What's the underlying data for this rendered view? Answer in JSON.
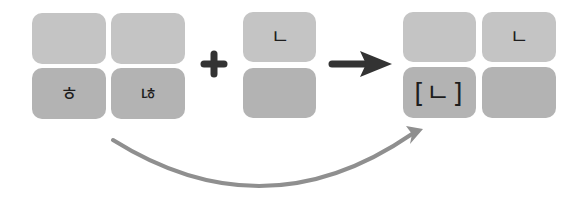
{
  "diagram": {
    "colors": {
      "tile_light": "#c4c4c4",
      "tile_dark": "#b3b3b3",
      "operator": "#333333",
      "curve_arrow": "#8f8f8f",
      "glyph": "#1e1e1e"
    },
    "left_group": {
      "tiles": [
        {
          "position": "top-left",
          "text": ""
        },
        {
          "position": "top-right",
          "text": ""
        },
        {
          "position": "bottom-left",
          "text": "ㅎ"
        },
        {
          "position": "bottom-right",
          "text": "ㄶ"
        }
      ]
    },
    "operator_plus": "+",
    "middle_group": {
      "tiles": [
        {
          "position": "top",
          "text": "ㄴ"
        },
        {
          "position": "bottom",
          "text": ""
        }
      ]
    },
    "operator_arrow": "→",
    "right_group": {
      "tiles": [
        {
          "position": "top-left",
          "text": ""
        },
        {
          "position": "top-right",
          "text": "ㄴ"
        },
        {
          "position": "bottom-left",
          "text": "[ㄴ]"
        },
        {
          "position": "bottom-right",
          "text": ""
        }
      ]
    },
    "curved_arrow": {
      "from": "left_group",
      "to": "right_group.bottom-left"
    }
  }
}
